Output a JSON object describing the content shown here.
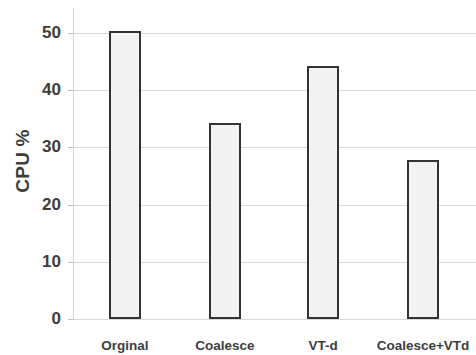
{
  "chart_data": {
    "type": "bar",
    "title": "",
    "xlabel": "",
    "ylabel": "CPU %",
    "categories": [
      "Orginal",
      "Coalesce",
      "VT-d",
      "Coalesce+VTd"
    ],
    "values": [
      50.4,
      34.2,
      44.2,
      27.8
    ],
    "ylim": [
      0,
      50
    ],
    "y_ticks": [
      0,
      10,
      20,
      30,
      40,
      50
    ],
    "y_tick_labels": [
      "0",
      "10",
      "20",
      "30",
      "40",
      "50"
    ],
    "grid": true,
    "legend": null,
    "series": [
      {
        "name": "CPU %",
        "values": [
          50.4,
          34.2,
          44.2,
          27.8
        ]
      }
    ],
    "colors": {
      "bar_fill": "#f2f2f2",
      "bar_border": "#333333",
      "gridline": "#d9d9d9",
      "text": "#3d3d3d",
      "background": "#ffffff"
    }
  }
}
